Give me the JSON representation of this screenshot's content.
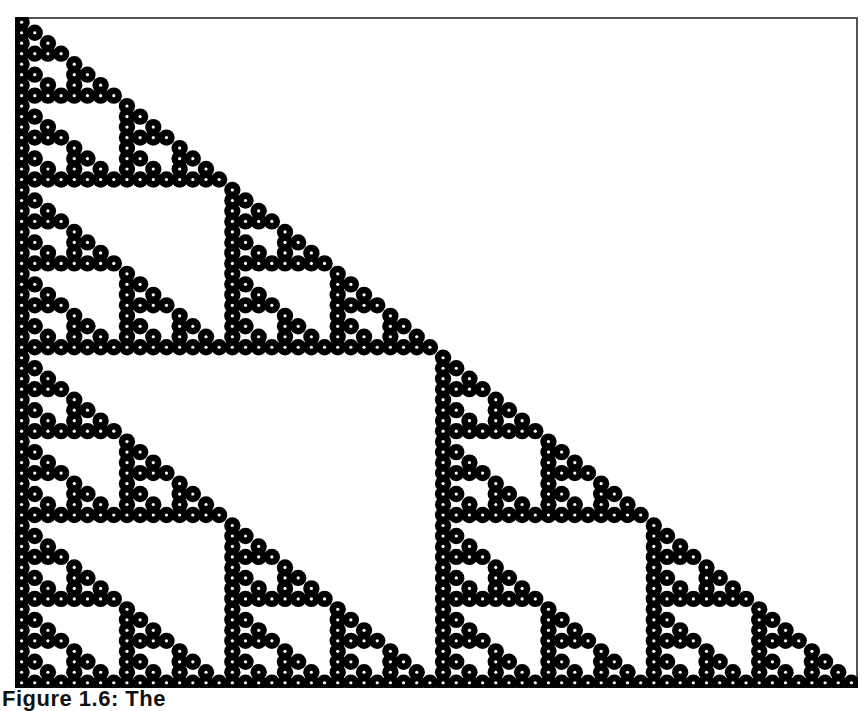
{
  "figure": {
    "caption": "Figure 1.6: The",
    "rows": 64,
    "cell_size": 13.17,
    "colors": {
      "cell": "#000000",
      "cell_center": "#ffffff",
      "background": "#ffffff",
      "frame": "#555555"
    }
  }
}
